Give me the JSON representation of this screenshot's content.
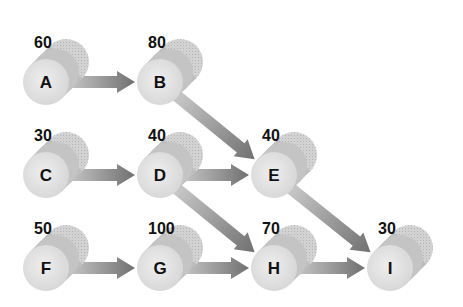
{
  "diagram": {
    "type": "activity-network",
    "nodes": [
      {
        "id": "A",
        "label": "A",
        "value": "60",
        "col": 0,
        "row": 0
      },
      {
        "id": "B",
        "label": "B",
        "value": "80",
        "col": 1,
        "row": 0
      },
      {
        "id": "C",
        "label": "C",
        "value": "30",
        "col": 0,
        "row": 1
      },
      {
        "id": "D",
        "label": "D",
        "value": "40",
        "col": 1,
        "row": 1
      },
      {
        "id": "E",
        "label": "E",
        "value": "40",
        "col": 2,
        "row": 1
      },
      {
        "id": "F",
        "label": "F",
        "value": "50",
        "col": 0,
        "row": 2
      },
      {
        "id": "G",
        "label": "G",
        "value": "100",
        "col": 1,
        "row": 2
      },
      {
        "id": "H",
        "label": "H",
        "value": "70",
        "col": 2,
        "row": 2
      },
      {
        "id": "I",
        "label": "I",
        "value": "30",
        "col": 3,
        "row": 2
      }
    ],
    "edges": [
      {
        "from": "A",
        "to": "B"
      },
      {
        "from": "B",
        "to": "E"
      },
      {
        "from": "C",
        "to": "D"
      },
      {
        "from": "D",
        "to": "E"
      },
      {
        "from": "D",
        "to": "H"
      },
      {
        "from": "E",
        "to": "I"
      },
      {
        "from": "F",
        "to": "G"
      },
      {
        "from": "G",
        "to": "H"
      },
      {
        "from": "H",
        "to": "I"
      }
    ],
    "colors": {
      "disk_front": "#e4e4e4",
      "disk_body": "#b8b8b8",
      "disk_back": "#cfcfcf",
      "arrow": "#8a8a8a",
      "text": "#111111"
    }
  }
}
